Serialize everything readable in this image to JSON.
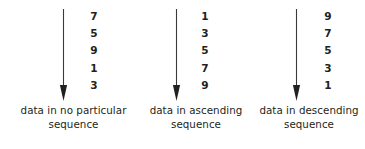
{
  "diagram": {
    "stroke_color": "#3a3a3a",
    "text_color": "#231f20",
    "background_color": "#ffffff",
    "columns": [
      {
        "arrow_icon": "down-arrow-icon",
        "arrow_direction": "down",
        "values": [
          "7",
          "5",
          "9",
          "1",
          "3"
        ],
        "caption_line1": "data in no particular",
        "caption_line2": "sequence"
      },
      {
        "arrow_icon": "down-arrow-icon",
        "arrow_direction": "down",
        "values": [
          "1",
          "3",
          "5",
          "7",
          "9"
        ],
        "caption_line1": "data in ascending",
        "caption_line2": "sequence"
      },
      {
        "arrow_icon": "down-arrow-icon",
        "arrow_direction": "down",
        "values": [
          "9",
          "7",
          "5",
          "3",
          "1"
        ],
        "caption_line1": "data in descending",
        "caption_line2": "sequence"
      }
    ]
  }
}
